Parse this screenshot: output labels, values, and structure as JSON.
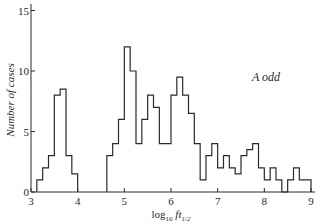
{
  "chart_data": {
    "type": "bar",
    "style": "step-histogram",
    "title": "",
    "xlabel": "log10 ft1/2",
    "xlabel_parts": {
      "main": "log",
      "sub1": "10",
      "italic": " ft",
      "sub2": "1/2"
    },
    "ylabel": "Number of cases",
    "annotation": "A odd",
    "xlim": [
      3,
      9
    ],
    "ylim": [
      0,
      15
    ],
    "x_ticks": [
      3,
      4,
      5,
      6,
      7,
      8,
      9
    ],
    "y_ticks": [
      0,
      5,
      10,
      15
    ],
    "grid": false,
    "legend": null,
    "bin_width": 0.125,
    "bins": [
      {
        "x0": 3.125,
        "x1": 3.25,
        "value": 1
      },
      {
        "x0": 3.25,
        "x1": 3.375,
        "value": 2
      },
      {
        "x0": 3.375,
        "x1": 3.5,
        "value": 3
      },
      {
        "x0": 3.5,
        "x1": 3.625,
        "value": 8
      },
      {
        "x0": 3.625,
        "x1": 3.75,
        "value": 8.5
      },
      {
        "x0": 3.75,
        "x1": 3.875,
        "value": 3
      },
      {
        "x0": 3.875,
        "x1": 4.0,
        "value": 1.5
      },
      {
        "x0": 4.625,
        "x1": 4.75,
        "value": 3
      },
      {
        "x0": 4.75,
        "x1": 4.875,
        "value": 4
      },
      {
        "x0": 4.875,
        "x1": 5.0,
        "value": 6
      },
      {
        "x0": 5.0,
        "x1": 5.125,
        "value": 12
      },
      {
        "x0": 5.125,
        "x1": 5.25,
        "value": 10
      },
      {
        "x0": 5.25,
        "x1": 5.375,
        "value": 4
      },
      {
        "x0": 5.375,
        "x1": 5.5,
        "value": 6
      },
      {
        "x0": 5.5,
        "x1": 5.625,
        "value": 8
      },
      {
        "x0": 5.625,
        "x1": 5.75,
        "value": 7
      },
      {
        "x0": 5.75,
        "x1": 5.875,
        "value": 4
      },
      {
        "x0": 5.875,
        "x1": 6.0,
        "value": 4
      },
      {
        "x0": 6.0,
        "x1": 6.125,
        "value": 8
      },
      {
        "x0": 6.125,
        "x1": 6.25,
        "value": 9.5
      },
      {
        "x0": 6.25,
        "x1": 6.375,
        "value": 8
      },
      {
        "x0": 6.375,
        "x1": 6.5,
        "value": 6.5
      },
      {
        "x0": 6.5,
        "x1": 6.625,
        "value": 4
      },
      {
        "x0": 6.625,
        "x1": 6.75,
        "value": 1
      },
      {
        "x0": 6.75,
        "x1": 6.875,
        "value": 3
      },
      {
        "x0": 6.875,
        "x1": 7.0,
        "value": 4
      },
      {
        "x0": 7.0,
        "x1": 7.125,
        "value": 2
      },
      {
        "x0": 7.125,
        "x1": 7.25,
        "value": 3
      },
      {
        "x0": 7.25,
        "x1": 7.375,
        "value": 2
      },
      {
        "x0": 7.375,
        "x1": 7.5,
        "value": 1.5
      },
      {
        "x0": 7.5,
        "x1": 7.625,
        "value": 3
      },
      {
        "x0": 7.625,
        "x1": 7.75,
        "value": 3.5
      },
      {
        "x0": 7.75,
        "x1": 7.875,
        "value": 4
      },
      {
        "x0": 7.875,
        "x1": 8.0,
        "value": 2
      },
      {
        "x0": 8.0,
        "x1": 8.125,
        "value": 1
      },
      {
        "x0": 8.125,
        "x1": 8.25,
        "value": 2
      },
      {
        "x0": 8.25,
        "x1": 8.375,
        "value": 1
      },
      {
        "x0": 8.375,
        "x1": 8.5,
        "value": 0
      },
      {
        "x0": 8.5,
        "x1": 8.625,
        "value": 1
      },
      {
        "x0": 8.625,
        "x1": 8.75,
        "value": 2
      },
      {
        "x0": 8.75,
        "x1": 8.875,
        "value": 1
      },
      {
        "x0": 8.875,
        "x1": 9.0,
        "value": 1
      }
    ]
  },
  "colors": {
    "line": "#2a2a2a",
    "background": "#ffffff"
  }
}
